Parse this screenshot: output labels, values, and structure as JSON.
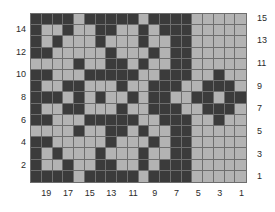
{
  "figure": {
    "type": "grid-pattern-chart",
    "title": "",
    "width_px": 275,
    "height_px": 212
  },
  "axes": {
    "left_ticks": [
      "14",
      "12",
      "10",
      "8",
      "6",
      "4",
      "2"
    ],
    "right_ticks": [
      "15",
      "13",
      "11",
      "9",
      "7",
      "5",
      "3",
      "1"
    ],
    "bottom_ticks": [
      "19",
      "17",
      "15",
      "13",
      "11",
      "9",
      "7",
      "5",
      "3",
      "1"
    ],
    "xlabel": "",
    "ylabel": ""
  },
  "colors": {
    "dark": "#3b3b3b",
    "light": "#b3b3b3",
    "gridline": "#6e6e6e",
    "background": "#ffffff",
    "text": "#2b2b2b"
  },
  "chart_data": {
    "type": "heatmap",
    "title": "",
    "xlabel": "",
    "ylabel": "",
    "ncols": 20,
    "nrows": 15,
    "xlim": [
      20,
      1
    ],
    "ylim": [
      1,
      15
    ],
    "x_tick_labels": [
      "19",
      "17",
      "15",
      "13",
      "11",
      "9",
      "7",
      "5",
      "3",
      "1"
    ],
    "y_tick_labels_left": [
      "14",
      "12",
      "10",
      "8",
      "6",
      "4",
      "2"
    ],
    "y_tick_labels_right": [
      "15",
      "13",
      "11",
      "9",
      "7",
      "5",
      "3",
      "1"
    ],
    "grid": true,
    "legend": "none",
    "value_map": {
      "1": "dark",
      "0": "light"
    },
    "column_order": "left-to-right is column 20 down to column 1",
    "row_order": "top-to-bottom is row 15 down to row 1",
    "values": [
      [
        1,
        1,
        1,
        1,
        0,
        1,
        1,
        1,
        1,
        1,
        0,
        1,
        1,
        1,
        1,
        0,
        0,
        0,
        0,
        0
      ],
      [
        1,
        0,
        0,
        1,
        0,
        0,
        1,
        1,
        0,
        0,
        1,
        0,
        1,
        1,
        1,
        0,
        0,
        0,
        0,
        0
      ],
      [
        1,
        0,
        1,
        0,
        0,
        0,
        1,
        0,
        0,
        0,
        1,
        0,
        0,
        1,
        1,
        0,
        0,
        0,
        0,
        0
      ],
      [
        1,
        1,
        0,
        0,
        0,
        0,
        0,
        1,
        0,
        0,
        0,
        1,
        0,
        1,
        1,
        0,
        0,
        0,
        0,
        0
      ],
      [
        0,
        0,
        0,
        0,
        1,
        0,
        0,
        1,
        1,
        0,
        1,
        0,
        0,
        1,
        1,
        0,
        0,
        0,
        0,
        0
      ],
      [
        1,
        1,
        0,
        0,
        0,
        1,
        1,
        1,
        1,
        1,
        0,
        0,
        1,
        1,
        1,
        0,
        0,
        1,
        0,
        0
      ],
      [
        1,
        0,
        0,
        1,
        1,
        0,
        0,
        0,
        1,
        0,
        0,
        1,
        1,
        1,
        0,
        0,
        1,
        1,
        1,
        0
      ],
      [
        1,
        1,
        1,
        0,
        1,
        0,
        1,
        0,
        0,
        1,
        0,
        1,
        1,
        0,
        0,
        1,
        1,
        0,
        1,
        1
      ],
      [
        1,
        0,
        0,
        1,
        1,
        0,
        0,
        0,
        1,
        0,
        0,
        1,
        1,
        1,
        0,
        0,
        1,
        1,
        1,
        0
      ],
      [
        1,
        1,
        0,
        0,
        0,
        1,
        1,
        1,
        1,
        1,
        0,
        0,
        1,
        1,
        1,
        0,
        0,
        1,
        0,
        0
      ],
      [
        0,
        0,
        0,
        0,
        1,
        0,
        0,
        1,
        1,
        0,
        1,
        0,
        0,
        1,
        1,
        0,
        0,
        0,
        0,
        0
      ],
      [
        1,
        1,
        0,
        0,
        0,
        0,
        0,
        1,
        0,
        0,
        0,
        1,
        0,
        1,
        1,
        0,
        0,
        0,
        0,
        0
      ],
      [
        1,
        0,
        1,
        0,
        0,
        0,
        1,
        0,
        0,
        0,
        1,
        0,
        0,
        1,
        1,
        0,
        0,
        0,
        0,
        0
      ],
      [
        1,
        0,
        0,
        1,
        0,
        0,
        1,
        1,
        0,
        0,
        1,
        0,
        1,
        1,
        1,
        0,
        0,
        0,
        0,
        0
      ],
      [
        1,
        1,
        1,
        1,
        0,
        1,
        1,
        1,
        1,
        1,
        0,
        1,
        1,
        1,
        1,
        0,
        0,
        0,
        0,
        0
      ]
    ]
  }
}
